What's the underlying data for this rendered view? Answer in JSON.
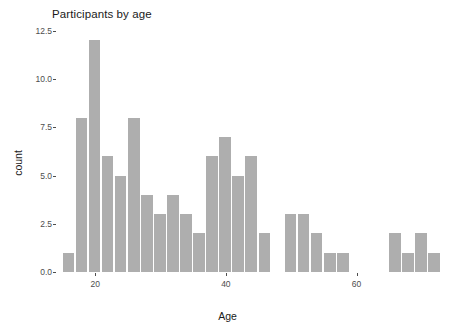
{
  "chart_data": {
    "type": "bar",
    "title": "Participants by age",
    "xlabel": "Age",
    "ylabel": "count",
    "xlim": [
      14,
      74
    ],
    "ylim": [
      0,
      12.8
    ],
    "grid": false,
    "legend": null,
    "bar_color": "#aeaeae",
    "binwidth": 2,
    "x_ticks": [
      20,
      40,
      60
    ],
    "x_tick_labels": [
      "20",
      "40",
      "60"
    ],
    "y_ticks": [
      0.0,
      2.5,
      5.0,
      7.5,
      10.0,
      12.5
    ],
    "y_tick_labels": [
      "0.0",
      "2.5",
      "5.0",
      "7.5",
      "10.0",
      "12.5"
    ],
    "categories": [
      16,
      18,
      20,
      22,
      24,
      26,
      28,
      30,
      32,
      34,
      36,
      38,
      40,
      42,
      44,
      46,
      48,
      50,
      52,
      54,
      56,
      58,
      60,
      62,
      64,
      66,
      68,
      70,
      72
    ],
    "values": [
      1,
      8,
      12,
      6,
      5,
      8,
      4,
      3,
      4,
      3,
      2,
      6,
      7,
      5,
      6,
      2,
      0,
      3,
      3,
      2,
      1,
      1,
      0,
      0,
      0,
      2,
      1,
      2,
      1
    ],
    "bars": [
      {
        "x": 16,
        "count": 1
      },
      {
        "x": 18,
        "count": 8
      },
      {
        "x": 20,
        "count": 12
      },
      {
        "x": 22,
        "count": 6
      },
      {
        "x": 24,
        "count": 5
      },
      {
        "x": 26,
        "count": 8
      },
      {
        "x": 28,
        "count": 4
      },
      {
        "x": 30,
        "count": 3
      },
      {
        "x": 32,
        "count": 4
      },
      {
        "x": 34,
        "count": 3
      },
      {
        "x": 36,
        "count": 2
      },
      {
        "x": 38,
        "count": 6
      },
      {
        "x": 40,
        "count": 7
      },
      {
        "x": 42,
        "count": 5
      },
      {
        "x": 44,
        "count": 6
      },
      {
        "x": 46,
        "count": 2
      },
      {
        "x": 50,
        "count": 3
      },
      {
        "x": 52,
        "count": 3
      },
      {
        "x": 54,
        "count": 2
      },
      {
        "x": 56,
        "count": 1
      },
      {
        "x": 58,
        "count": 1
      },
      {
        "x": 66,
        "count": 2
      },
      {
        "x": 68,
        "count": 1
      },
      {
        "x": 70,
        "count": 2
      },
      {
        "x": 72,
        "count": 1
      }
    ]
  }
}
